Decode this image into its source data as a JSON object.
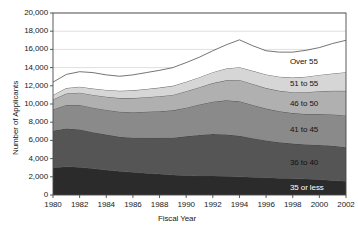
{
  "chart_data": {
    "type": "area",
    "stacked": true,
    "title": "",
    "xlabel": "Fiscal Year",
    "ylabel": "Number of Applicants",
    "x": [
      1980,
      1981,
      1982,
      1983,
      1984,
      1985,
      1986,
      1987,
      1988,
      1989,
      1990,
      1991,
      1992,
      1993,
      1994,
      1995,
      1996,
      1997,
      1998,
      1999,
      2000,
      2001,
      2002
    ],
    "xlim": [
      1980,
      2002
    ],
    "ylim": [
      0,
      20000
    ],
    "yticks": [
      0,
      2000,
      4000,
      6000,
      8000,
      10000,
      12000,
      14000,
      16000,
      18000,
      20000
    ],
    "ytick_labels": [
      "0",
      "2,000",
      "4,000",
      "6,000",
      "8,000",
      "10,000",
      "12,000",
      "14,000",
      "16,000",
      "18,000",
      "20,000"
    ],
    "xticks": [
      1980,
      1982,
      1984,
      1986,
      1988,
      1990,
      1992,
      1994,
      1996,
      1998,
      2000,
      2002
    ],
    "xtick_labels": [
      "1980",
      "1982",
      "1984",
      "1986",
      "1988",
      "1990",
      "1992",
      "1994",
      "1996",
      "1998",
      "2000",
      "2002"
    ],
    "grid": "horizontal",
    "legend_position": "inline-right",
    "series": [
      {
        "name": "35 or less",
        "label": "35 or less",
        "color": "#2b2b2b",
        "label_color": "#ffffff",
        "values": [
          3000,
          3100,
          3050,
          2900,
          2750,
          2600,
          2500,
          2400,
          2300,
          2200,
          2150,
          2100,
          2100,
          2050,
          2000,
          1950,
          1900,
          1850,
          1800,
          1750,
          1700,
          1600,
          1500
        ]
      },
      {
        "name": "36 to 40",
        "label": "36 to 40",
        "color": "#555555",
        "label_color": "#111111",
        "values": [
          4050,
          4200,
          4150,
          4000,
          3900,
          3800,
          3800,
          3900,
          4000,
          4100,
          4300,
          4500,
          4600,
          4600,
          4500,
          4300,
          4100,
          3950,
          3850,
          3800,
          3800,
          3800,
          3750
        ]
      },
      {
        "name": "41 to 45",
        "label": "41 to 45",
        "color": "#8a8a8a",
        "label_color": "#111111",
        "values": [
          2350,
          2600,
          2700,
          2700,
          2700,
          2750,
          2800,
          2850,
          2900,
          3000,
          3150,
          3350,
          3550,
          3750,
          3800,
          3650,
          3500,
          3400,
          3350,
          3350,
          3400,
          3450,
          3500
        ]
      },
      {
        "name": "46 to 50",
        "label": "46 to 50",
        "color": "#b0b0b0",
        "label_color": "#111111",
        "values": [
          1100,
          1250,
          1350,
          1400,
          1450,
          1500,
          1550,
          1600,
          1650,
          1700,
          1800,
          1900,
          2050,
          2200,
          2350,
          2300,
          2250,
          2250,
          2300,
          2400,
          2500,
          2600,
          2700
        ]
      },
      {
        "name": "51 to 55",
        "label": "51 to 55",
        "color": "#d6d6d6",
        "label_color": "#111111",
        "values": [
          500,
          600,
          650,
          700,
          750,
          800,
          850,
          900,
          950,
          1000,
          1050,
          1100,
          1200,
          1300,
          1400,
          1450,
          1500,
          1550,
          1600,
          1700,
          1800,
          1900,
          2050
        ]
      },
      {
        "name": "Over 55",
        "label": "Over 55",
        "color": "#ffffff",
        "label_color": "#111111",
        "values": [
          1400,
          1500,
          1650,
          1750,
          1650,
          1600,
          1700,
          1800,
          1900,
          2000,
          2100,
          2200,
          2350,
          2600,
          3000,
          2750,
          2600,
          2700,
          2800,
          2900,
          3000,
          3300,
          3500
        ]
      }
    ],
    "totals": [
      12400,
      13250,
      13550,
      13450,
      13200,
      13050,
      13200,
      13450,
      13700,
      14000,
      14550,
      15150,
      15850,
      16500,
      17050,
      16400,
      15850,
      15700,
      15700,
      15900,
      16200,
      16650,
      17000
    ]
  }
}
